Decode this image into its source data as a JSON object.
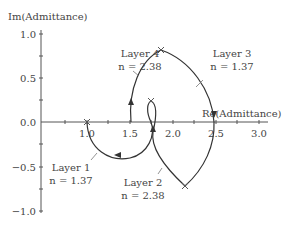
{
  "axes": {
    "ylabel": "Im(Admittance)",
    "xlabel": "Re(Admittance)",
    "yticks": [
      "1.0",
      "0.5",
      "0.0",
      "−0.5",
      "−1.0"
    ],
    "xticks": [
      "1.0",
      "1.5",
      "2.0",
      "2.5",
      "3.0"
    ]
  },
  "layers": [
    {
      "name": "Layer 1",
      "index": "n = 1.37"
    },
    {
      "name": "Layer 2",
      "index": "n = 2.38"
    },
    {
      "name": "Layer 3",
      "index": "n = 1.37"
    },
    {
      "name": "Layer 4",
      "index": "n = 2.38"
    }
  ],
  "colors": {
    "curve": "#333333",
    "text": "#444444"
  }
}
